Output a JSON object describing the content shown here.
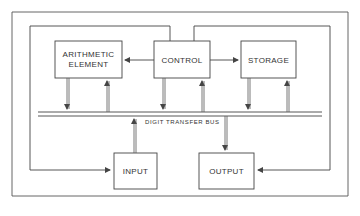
{
  "diagram": {
    "blocks": {
      "arithmetic_line1": "ARITHMETIC",
      "arithmetic_line2": "ELEMENT",
      "control": "CONTROL",
      "storage": "STORAGE",
      "input": "INPUT",
      "output": "OUTPUT"
    },
    "bus_label": "DIGIT  TRANSFER  BUS",
    "colors": {
      "line": "#444444",
      "background": "#ffffff"
    }
  }
}
